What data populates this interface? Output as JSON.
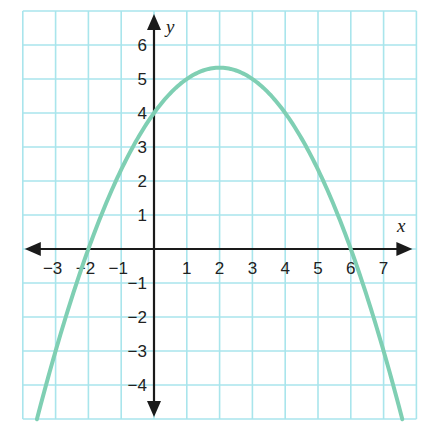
{
  "chart_data": {
    "type": "line",
    "title": "",
    "xlabel": "x",
    "ylabel": "y",
    "xlim": [
      -4,
      8
    ],
    "ylim": [
      -5,
      7
    ],
    "grid": true,
    "x_ticks": [
      -3,
      -2,
      -1,
      1,
      2,
      3,
      4,
      5,
      6,
      7
    ],
    "y_ticks": [
      -4,
      -3,
      -2,
      -1,
      1,
      2,
      3,
      4,
      5,
      6
    ],
    "x_tick_labels": [
      "−3",
      "−2",
      "−1",
      "1",
      "2",
      "3",
      "4",
      "5",
      "6",
      "7"
    ],
    "y_tick_labels": [
      "−4",
      "−3",
      "−2",
      "−1",
      "1",
      "2",
      "3",
      "4",
      "5",
      "6"
    ],
    "series": [
      {
        "name": "parabola",
        "equation": "y = -(1/3)(x + 2)(x - 6)",
        "x": [
          -3.57,
          -3,
          -2,
          -1,
          0,
          1,
          2,
          3,
          4,
          5,
          6,
          7,
          7.57
        ],
        "y": [
          -5,
          -3,
          0,
          2.33,
          4,
          5,
          5.33,
          5,
          4,
          2.33,
          0,
          -3,
          -5
        ],
        "color": "#7fcfb3"
      }
    ],
    "key_points": {
      "x_intercepts": [
        -2,
        6
      ],
      "y_intercept": 4,
      "vertex": [
        2,
        5.33
      ]
    }
  },
  "colors": {
    "grid": "#a9e5ec",
    "curve": "#7fcfb3",
    "axis": "#1a1a1a"
  }
}
